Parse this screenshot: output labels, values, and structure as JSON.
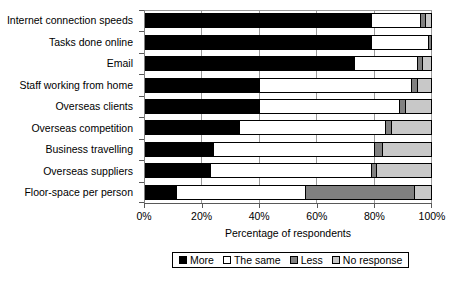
{
  "chart_data": {
    "type": "bar",
    "orientation": "horizontal",
    "stacked": true,
    "title": "",
    "xlabel": "Percentage of respondents",
    "ylabel": "",
    "xlim": [
      0,
      100
    ],
    "xticks": [
      0,
      20,
      40,
      60,
      80,
      100
    ],
    "xticklabels": [
      "0%",
      "20%",
      "40%",
      "60%",
      "80%",
      "100%"
    ],
    "grid": "vertical",
    "legend_position": "bottom-center",
    "categories": [
      "Internet connection speeds",
      "Tasks done online",
      "Email",
      "Staff working from home",
      "Overseas clients",
      "Overseas competition",
      "Business travelling",
      "Overseas suppliers",
      "Floor-space per person"
    ],
    "series": [
      {
        "name": "More",
        "color": "#000000",
        "values": [
          79,
          79,
          73,
          40,
          40,
          33,
          24,
          23,
          11
        ]
      },
      {
        "name": "The same",
        "color": "#ffffff",
        "values": [
          17,
          20,
          22,
          53,
          49,
          51,
          56,
          56,
          45
        ]
      },
      {
        "name": "Less",
        "color": "#808080",
        "values": [
          2,
          1,
          2,
          2,
          2,
          2,
          3,
          2,
          38
        ]
      },
      {
        "name": "No response",
        "color": "#c8c8c8",
        "values": [
          2,
          0,
          3,
          5,
          9,
          14,
          17,
          19,
          6
        ]
      }
    ]
  },
  "legend": {
    "items": [
      {
        "label": "More",
        "swatch": "sw-more"
      },
      {
        "label": "The same",
        "swatch": "sw-same"
      },
      {
        "label": "Less",
        "swatch": "sw-less"
      },
      {
        "label": "No response",
        "swatch": "sw-noresp"
      }
    ]
  }
}
